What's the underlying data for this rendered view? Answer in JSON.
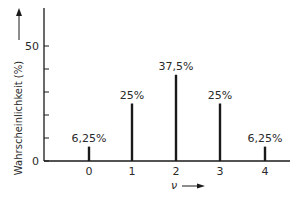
{
  "chart_data": {
    "type": "bar",
    "title": "",
    "xlabel": "ν",
    "ylabel": "Wahrscheinlichkeit (%)",
    "categories": [
      "0",
      "1",
      "2",
      "3",
      "4"
    ],
    "values": [
      6.25,
      25,
      37.5,
      25,
      6.25
    ],
    "data_labels": [
      "6,25%",
      "25%",
      "37,5%",
      "25%",
      "6,25%"
    ],
    "ylim": [
      0,
      65
    ],
    "yticks_labeled": [
      "0",
      "50"
    ],
    "yticks_minor_step": 10,
    "grid": false,
    "legend": null,
    "bar_style": "thin vertical lines (stick plot)"
  },
  "axes": {
    "y_label": "Wahrscheinlichkeit (%)",
    "x_label": "ν",
    "y_tick_0": "0",
    "y_tick_50": "50"
  },
  "colors": {
    "ink": "#1a1a1a",
    "background": "#ffffff"
  }
}
